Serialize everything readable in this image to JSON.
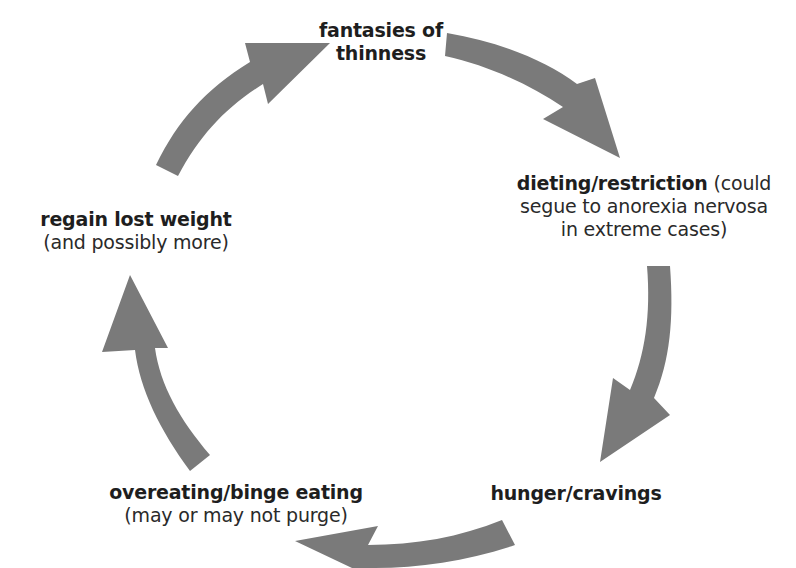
{
  "diagram": {
    "type": "cycle",
    "arrow_color": "#7a7a7a",
    "text_color": "#1e1e1e",
    "nodes": [
      {
        "id": "fantasies",
        "title": "fantasies of",
        "title_line2": "thinness",
        "note": ""
      },
      {
        "id": "dieting",
        "title": "dieting/restriction",
        "note_inline": " (could",
        "note_line2": "segue to anorexia nervosa",
        "note_line3": "in extreme cases)"
      },
      {
        "id": "hunger",
        "title": "hunger/cravings",
        "note": ""
      },
      {
        "id": "overeating",
        "title": "overeating/binge eating",
        "note": "(may or may not purge)"
      },
      {
        "id": "regain",
        "title": "regain lost weight",
        "note": "(and possibly more)"
      }
    ],
    "edges": [
      {
        "from": "fantasies",
        "to": "dieting"
      },
      {
        "from": "dieting",
        "to": "hunger"
      },
      {
        "from": "hunger",
        "to": "overeating"
      },
      {
        "from": "overeating",
        "to": "regain"
      },
      {
        "from": "regain",
        "to": "fantasies"
      }
    ]
  }
}
